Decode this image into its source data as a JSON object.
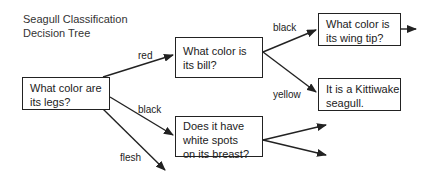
{
  "title": {
    "line1": "Seagull Classification",
    "line2": "Decision Tree"
  },
  "nodes": {
    "legs": {
      "line1": "What color are",
      "line2": "its legs?"
    },
    "bill": {
      "line1": "What color is",
      "line2": "its bill?"
    },
    "wingtip": {
      "line1": "What color is",
      "line2": "its wing tip?"
    },
    "kittiwake": {
      "line1": "It is a Kittiwake",
      "line2": "seagull."
    },
    "spots": {
      "line1": "Does it have",
      "line2": "white spots",
      "line3": "on its breast?"
    }
  },
  "edges": {
    "red": "red",
    "black_legs": "black",
    "flesh": "flesh",
    "black_bill": "black",
    "yellow": "yellow"
  },
  "colors": {
    "stroke": "#222222",
    "background": "#ffffff"
  }
}
